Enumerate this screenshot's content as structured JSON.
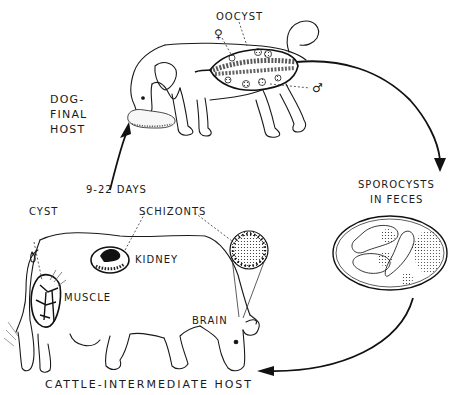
{
  "diagram": {
    "hosts": {
      "final": {
        "line1": "DOG-",
        "line2": "FINAL",
        "line3": "HOST"
      },
      "intermediate": "CATTLE-INTERMEDIATE HOST"
    },
    "stages": {
      "oocyst": "OOCYST",
      "sporocysts_line1": "SPOROCYSTS",
      "sporocysts_line2": "IN FECES",
      "interval": "9-22 DAYS"
    },
    "tissues": {
      "cyst": "CYST",
      "schizonts": "SCHIZONTS",
      "kidney": "KIDNEY",
      "muscle": "MUSCLE",
      "brain": "BRAIN"
    },
    "symbols": {
      "female": "♀",
      "male": "♂"
    },
    "colors": {
      "ink": "#1a1a1a",
      "background": "#ffffff"
    }
  }
}
